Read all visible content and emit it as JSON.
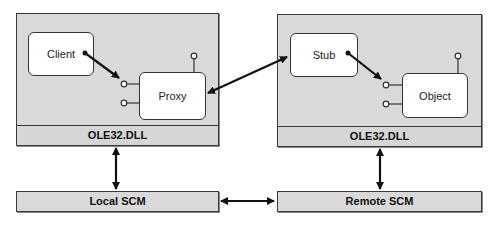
{
  "diagram": {
    "local_process": {
      "components": {
        "client": "Client",
        "proxy": "Proxy"
      },
      "dll_label": "OLE32.DLL"
    },
    "remote_process": {
      "components": {
        "stub": "Stub",
        "object": "Object"
      },
      "dll_label": "OLE32.DLL"
    },
    "scm": {
      "local": "Local SCM",
      "remote": "Remote SCM"
    },
    "connections": [
      {
        "from": "Client",
        "to": "Proxy interface",
        "type": "arrow"
      },
      {
        "from": "Proxy",
        "to": "Stub",
        "type": "bidirectional-arrow"
      },
      {
        "from": "Stub",
        "to": "Object interface",
        "type": "arrow"
      },
      {
        "from": "OLE32.DLL (local)",
        "to": "Local SCM",
        "type": "bidirectional-arrow"
      },
      {
        "from": "OLE32.DLL (remote)",
        "to": "Remote SCM",
        "type": "bidirectional-arrow"
      },
      {
        "from": "Local SCM",
        "to": "Remote SCM",
        "type": "bidirectional-arrow"
      }
    ],
    "colors": {
      "panel": "#d9d9d9",
      "border": "#3a3a3a",
      "component": "#ffffff"
    }
  }
}
